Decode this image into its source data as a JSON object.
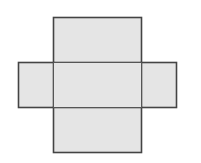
{
  "diagram": {
    "type": "net-of-rectangular-prism",
    "fill_color": "#e5e5e5",
    "stroke_color": "#444444",
    "faces": [
      {
        "name": "top-face",
        "x": 53,
        "y": 17,
        "w": 88,
        "h": 45
      },
      {
        "name": "left-face",
        "x": 18,
        "y": 62,
        "w": 35,
        "h": 45
      },
      {
        "name": "center-face",
        "x": 53,
        "y": 62,
        "w": 88,
        "h": 45
      },
      {
        "name": "right-face",
        "x": 141,
        "y": 62,
        "w": 35,
        "h": 45
      },
      {
        "name": "bottom-face",
        "x": 53,
        "y": 107,
        "w": 88,
        "h": 45
      }
    ]
  }
}
